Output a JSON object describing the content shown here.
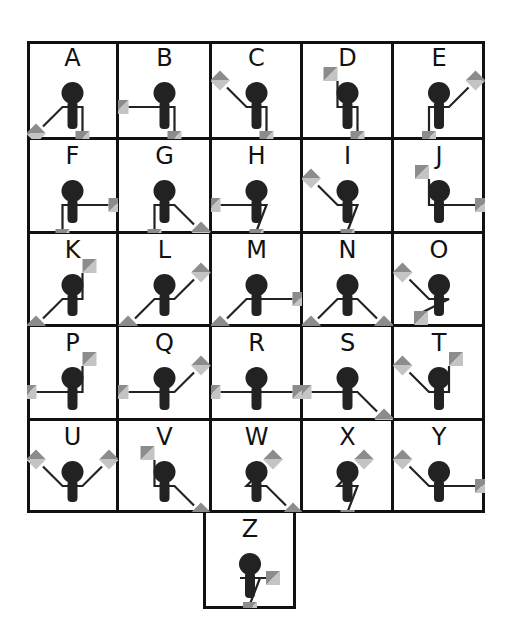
{
  "colors": {
    "line": "#111111",
    "figure": "#222222",
    "flag_dark": "#8c8c8c",
    "flag_light": "#c4c4c4",
    "background": "#ffffff"
  },
  "grid": {
    "columns": 5,
    "rows": 5,
    "col_edges": [
      27,
      118,
      211,
      302,
      393,
      485
    ],
    "row_edges": [
      41,
      139,
      233,
      326,
      420,
      512
    ]
  },
  "letters": [
    {
      "label": "A",
      "arms": [
        "SW",
        "S"
      ]
    },
    {
      "label": "B",
      "arms": [
        "W",
        "S"
      ]
    },
    {
      "label": "C",
      "arms": [
        "NW",
        "S"
      ]
    },
    {
      "label": "D",
      "arms": [
        "N",
        "S"
      ]
    },
    {
      "label": "E",
      "arms": [
        "S",
        "NE"
      ]
    },
    {
      "label": "F",
      "arms": [
        "S",
        "E"
      ]
    },
    {
      "label": "G",
      "arms": [
        "S",
        "SE"
      ]
    },
    {
      "label": "H",
      "arms": [
        "W",
        "SX"
      ]
    },
    {
      "label": "I",
      "arms": [
        "NW",
        "SX"
      ]
    },
    {
      "label": "J",
      "arms": [
        "N",
        "E"
      ]
    },
    {
      "label": "K",
      "arms": [
        "SW",
        "N"
      ]
    },
    {
      "label": "L",
      "arms": [
        "SW",
        "NE"
      ]
    },
    {
      "label": "M",
      "arms": [
        "SW",
        "E"
      ]
    },
    {
      "label": "N",
      "arms": [
        "SW",
        "SE"
      ]
    },
    {
      "label": "O",
      "arms": [
        "NW",
        "WX"
      ]
    },
    {
      "label": "P",
      "arms": [
        "W",
        "N"
      ]
    },
    {
      "label": "Q",
      "arms": [
        "W",
        "NE"
      ]
    },
    {
      "label": "R",
      "arms": [
        "W",
        "E"
      ]
    },
    {
      "label": "S",
      "arms": [
        "W",
        "SE"
      ]
    },
    {
      "label": "T",
      "arms": [
        "NW",
        "N"
      ]
    },
    {
      "label": "U",
      "arms": [
        "NW",
        "NE"
      ]
    },
    {
      "label": "V",
      "arms": [
        "N",
        "SE"
      ]
    },
    {
      "label": "W",
      "arms": [
        "NE",
        "SE"
      ]
    },
    {
      "label": "X",
      "arms": [
        "NE",
        "SX"
      ]
    },
    {
      "label": "Y",
      "arms": [
        "NW",
        "E"
      ]
    },
    {
      "label": "Z",
      "arms": [
        "E",
        "SX"
      ]
    }
  ]
}
